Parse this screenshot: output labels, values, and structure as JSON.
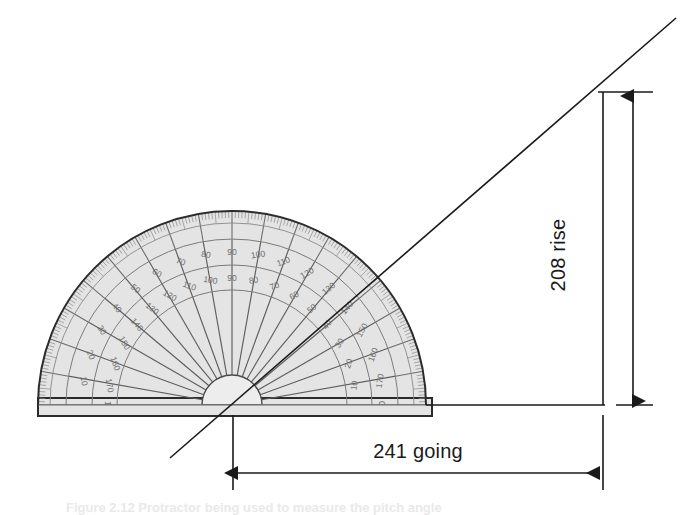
{
  "figure": {
    "background_color": "#ffffff",
    "line_color": "#1a1a1a"
  },
  "dimensions": {
    "rise": {
      "label": "208 rise",
      "value": 208,
      "unit_word": "rise",
      "orientation": "vertical",
      "text_rotation_deg": -90
    },
    "going": {
      "label": "241 going",
      "value": 241,
      "unit_word": "going",
      "orientation": "horizontal",
      "text_rotation_deg": 0
    }
  },
  "protractor": {
    "type": "semicircular-protractor",
    "body_fill": "#e4e4e4",
    "body_stroke": "#2b2b2b",
    "scale_stroke": "#7b7b7b",
    "center_x": 232,
    "center_y": 405,
    "radius": 194,
    "major_tick_step_deg": 10,
    "minor_tick_step_deg": 1,
    "outer_scale_numbers": [
      "0",
      "10",
      "20",
      "30",
      "40",
      "50",
      "60",
      "70",
      "80",
      "90",
      "100",
      "110",
      "120",
      "130",
      "140",
      "150",
      "160",
      "170",
      "180"
    ],
    "inner_scale_numbers": [
      "180",
      "170",
      "160",
      "150",
      "140",
      "130",
      "120",
      "110",
      "100",
      "90",
      "80",
      "70",
      "60",
      "50",
      "40",
      "30",
      "20",
      "10",
      "0"
    ]
  },
  "slope_line": {
    "name": "pitch-line",
    "angle_deg": 41,
    "from_x": 170,
    "from_y": 458,
    "to_x": 676,
    "to_y": 18
  },
  "caption": {
    "text": "Figure 2.12 Protractor being used to measure the pitch angle"
  }
}
